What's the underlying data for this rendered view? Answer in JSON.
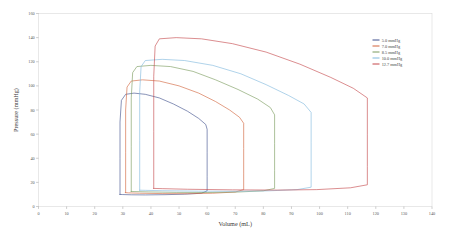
{
  "chart_data": {
    "type": "line",
    "title": "",
    "xlabel": "Volume (mL)",
    "ylabel": "Pressure (mmHg)",
    "xlim": [
      0,
      140
    ],
    "ylim": [
      0,
      160
    ],
    "xticks": [
      0,
      10,
      20,
      30,
      40,
      50,
      60,
      70,
      80,
      90,
      100,
      110,
      120,
      130,
      140
    ],
    "yticks": [
      0,
      20,
      40,
      60,
      80,
      100,
      120,
      140,
      160
    ],
    "grid": false,
    "legend_position": "upper-right",
    "series": [
      {
        "name": "5.0 mmHg",
        "color": "#3f4f8c",
        "end_diastolic_volume": 60,
        "end_systolic_volume": 29,
        "peak_pressure": 94,
        "filling_pressure": 10,
        "stroke_volume": 31,
        "points": [
          [
            29,
            10
          ],
          [
            29,
            40
          ],
          [
            29,
            70
          ],
          [
            29.5,
            88
          ],
          [
            31,
            93
          ],
          [
            34,
            94
          ],
          [
            38,
            93
          ],
          [
            43,
            90
          ],
          [
            48,
            85
          ],
          [
            53,
            79
          ],
          [
            57,
            73
          ],
          [
            59.5,
            68
          ],
          [
            60,
            64
          ],
          [
            60,
            45
          ],
          [
            60,
            25
          ],
          [
            60,
            13
          ],
          [
            58,
            11
          ],
          [
            52,
            10.2
          ],
          [
            45,
            9.8
          ],
          [
            38,
            9.6
          ],
          [
            33,
            9.7
          ],
          [
            30,
            9.9
          ],
          [
            29,
            10
          ]
        ]
      },
      {
        "name": "7.0 mmHg",
        "color": "#d2633a",
        "end_diastolic_volume": 73,
        "end_systolic_volume": 31,
        "peak_pressure": 105,
        "filling_pressure": 11.5,
        "stroke_volume": 42,
        "points": [
          [
            31,
            11.5
          ],
          [
            31,
            45
          ],
          [
            31,
            80
          ],
          [
            31.5,
            99
          ],
          [
            33,
            104
          ],
          [
            37,
            105
          ],
          [
            43,
            104
          ],
          [
            50,
            100
          ],
          [
            57,
            94
          ],
          [
            63,
            87
          ],
          [
            68,
            80
          ],
          [
            71.5,
            74
          ],
          [
            73,
            69
          ],
          [
            73,
            48
          ],
          [
            73,
            27
          ],
          [
            73,
            14
          ],
          [
            70,
            12
          ],
          [
            62,
            11
          ],
          [
            53,
            10.6
          ],
          [
            44,
            10.7
          ],
          [
            36,
            11
          ],
          [
            32,
            11.3
          ],
          [
            31,
            11.5
          ]
        ]
      },
      {
        "name": "8.5 mmHg",
        "color": "#7a9a5c",
        "end_diastolic_volume": 84,
        "end_systolic_volume": 33,
        "peak_pressure": 117,
        "filling_pressure": 12.5,
        "stroke_volume": 51,
        "points": [
          [
            33,
            12.5
          ],
          [
            33,
            50
          ],
          [
            33,
            90
          ],
          [
            33.5,
            111
          ],
          [
            35,
            116
          ],
          [
            40,
            117
          ],
          [
            47,
            116
          ],
          [
            55,
            112
          ],
          [
            63,
            105
          ],
          [
            71,
            97
          ],
          [
            78,
            89
          ],
          [
            82.5,
            82
          ],
          [
            84,
            76
          ],
          [
            84,
            52
          ],
          [
            84,
            30
          ],
          [
            84,
            15
          ],
          [
            80,
            13
          ],
          [
            71,
            12
          ],
          [
            60,
            11.6
          ],
          [
            49,
            11.7
          ],
          [
            39,
            12.1
          ],
          [
            34,
            12.4
          ],
          [
            33,
            12.5
          ]
        ]
      },
      {
        "name": "10.0 mmHg",
        "color": "#7fb8dd",
        "end_diastolic_volume": 97,
        "end_systolic_volume": 36,
        "peak_pressure": 122,
        "filling_pressure": 13.5,
        "stroke_volume": 61,
        "points": [
          [
            36,
            13.5
          ],
          [
            36,
            55
          ],
          [
            36,
            95
          ],
          [
            36.5,
            116
          ],
          [
            38,
            121
          ],
          [
            44,
            122
          ],
          [
            52,
            121
          ],
          [
            62,
            117
          ],
          [
            72,
            110
          ],
          [
            81,
            101
          ],
          [
            89,
            92
          ],
          [
            94.5,
            85
          ],
          [
            97,
            78
          ],
          [
            97,
            53
          ],
          [
            97,
            30
          ],
          [
            97,
            16
          ],
          [
            92,
            14
          ],
          [
            82,
            13
          ],
          [
            70,
            12.6
          ],
          [
            57,
            12.7
          ],
          [
            44,
            13.1
          ],
          [
            38,
            13.4
          ],
          [
            36,
            13.5
          ]
        ]
      },
      {
        "name": "12.7 mmHg",
        "color": "#c4474a",
        "end_diastolic_volume": 117,
        "end_systolic_volume": 41,
        "peak_pressure": 140,
        "filling_pressure": 15,
        "stroke_volume": 76,
        "points": [
          [
            41,
            15
          ],
          [
            41,
            62
          ],
          [
            41,
            108
          ],
          [
            41.5,
            133
          ],
          [
            43,
            139
          ],
          [
            49,
            140
          ],
          [
            58,
            139
          ],
          [
            69,
            135
          ],
          [
            81,
            128
          ],
          [
            93,
            118
          ],
          [
            104,
            107
          ],
          [
            112,
            98
          ],
          [
            117,
            90
          ],
          [
            117,
            60
          ],
          [
            117,
            33
          ],
          [
            117,
            18
          ],
          [
            111,
            15.5
          ],
          [
            99,
            14
          ],
          [
            85,
            13.6
          ],
          [
            69,
            13.8
          ],
          [
            53,
            14.3
          ],
          [
            44,
            14.8
          ],
          [
            41,
            15
          ]
        ]
      }
    ]
  },
  "legend": {
    "entries": [
      {
        "label": "5.0 mmHg",
        "color": "#3f4f8c"
      },
      {
        "label": "7.0 mmHg",
        "color": "#d2633a"
      },
      {
        "label": "8.5 mmHg",
        "color": "#7a9a5c"
      },
      {
        "label": "10.0 mmHg",
        "color": "#7fb8dd"
      },
      {
        "label": "12.7 mmHg",
        "color": "#c4474a"
      }
    ]
  },
  "axes": {
    "x_title": "Volume (mL)",
    "y_title": "Pressure (mmHg)",
    "x_tick_labels": [
      "0",
      "10",
      "20",
      "30",
      "40",
      "50",
      "60",
      "70",
      "80",
      "90",
      "100",
      "110",
      "120",
      "130",
      "140"
    ],
    "y_tick_labels": [
      "0",
      "20",
      "40",
      "60",
      "80",
      "100",
      "120",
      "140",
      "160"
    ]
  }
}
